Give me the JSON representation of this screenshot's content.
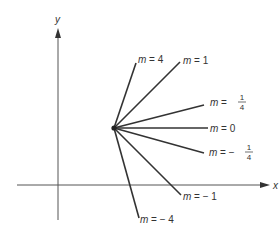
{
  "diagram": {
    "axes": {
      "x_label": "x",
      "y_label": "y"
    },
    "center_point": {
      "x": 114,
      "y": 128
    },
    "lines": [
      {
        "slope": "4",
        "label_prefix": "m = ",
        "label_value": "4",
        "fraction": false,
        "end": [
          136,
          63
        ],
        "label_pos": [
          137,
          60
        ]
      },
      {
        "slope": "1",
        "label_prefix": "m = ",
        "label_value": "1",
        "fraction": false,
        "end": [
          180,
          62
        ],
        "label_pos": [
          183,
          61
        ]
      },
      {
        "slope": "1/4",
        "label_prefix": "m = ",
        "label_value": "1/4",
        "fraction": true,
        "sign": "",
        "num": "1",
        "den": "4",
        "end": [
          204,
          105
        ],
        "label_pos": [
          210,
          104
        ]
      },
      {
        "slope": "0",
        "label_prefix": "m = ",
        "label_value": "0",
        "fraction": false,
        "end": [
          208,
          128
        ],
        "label_pos": [
          210,
          131
        ]
      },
      {
        "slope": "-1/4",
        "label_prefix": "m = ",
        "label_value": "−1/4",
        "fraction": true,
        "sign": "−",
        "num": "1",
        "den": "4",
        "end": [
          204,
          153
        ],
        "label_pos": [
          209,
          155
        ]
      },
      {
        "slope": "-1",
        "label_prefix": "m = ",
        "label_value": "− 1",
        "fraction": false,
        "end": [
          181,
          195
        ],
        "label_pos": [
          183,
          198
        ]
      },
      {
        "slope": "-4",
        "label_prefix": "m = ",
        "label_value": "− 4",
        "fraction": false,
        "end": [
          139,
          218
        ],
        "label_pos": [
          141,
          222
        ]
      }
    ],
    "colors": {
      "line": "#333333",
      "axis": "#555555",
      "text": "#333333"
    }
  }
}
